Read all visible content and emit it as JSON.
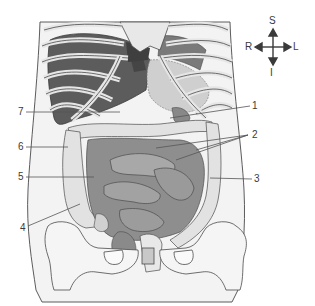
{
  "figure": {
    "type": "anatomical-diagram",
    "colors": {
      "outline": "#4a4a4a",
      "bone": "#efefef",
      "liver": "#5a5a5a",
      "dark_organ": "#6e6e6e",
      "small_intestine": "#8c8c8c",
      "colon": "#d9d9d9",
      "stomach": "#c4c4c4",
      "background": "#ffffff",
      "leader_line": "#555555"
    }
  },
  "compass": {
    "superior": "S",
    "inferior": "I",
    "right": "R",
    "left": "L"
  },
  "labels": [
    {
      "id": "1",
      "text": "1",
      "side": "right"
    },
    {
      "id": "2",
      "text": "2",
      "side": "right"
    },
    {
      "id": "3",
      "text": "3",
      "side": "right"
    },
    {
      "id": "4",
      "text": "4",
      "side": "left"
    },
    {
      "id": "5",
      "text": "5",
      "side": "left"
    },
    {
      "id": "6",
      "text": "6",
      "side": "left"
    },
    {
      "id": "7",
      "text": "7",
      "side": "left"
    }
  ]
}
